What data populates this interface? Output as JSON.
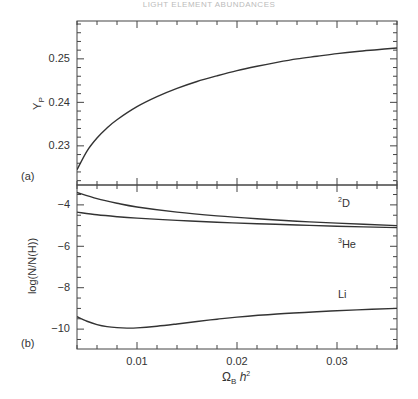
{
  "header": "LIGHT ELEMENT ABUNDANCES",
  "chart_data": [
    {
      "type": "line",
      "panel": "(a)",
      "title": "",
      "xlabel": "",
      "ylabel": "Y_P",
      "xlim": [
        0.004,
        0.036
      ],
      "ylim": [
        0.221,
        0.2587
      ],
      "yticks": [
        "0.23",
        "0.24",
        "0.25"
      ],
      "grid": false,
      "series": [
        {
          "name": "Yp",
          "x": [
            0.004,
            0.005,
            0.006,
            0.007,
            0.008,
            0.01,
            0.012,
            0.014,
            0.016,
            0.018,
            0.02,
            0.022,
            0.024,
            0.026,
            0.028,
            0.03,
            0.032,
            0.034,
            0.036
          ],
          "y": [
            0.2245,
            0.2288,
            0.2318,
            0.2341,
            0.236,
            0.239,
            0.2413,
            0.2432,
            0.2448,
            0.2461,
            0.2473,
            0.2483,
            0.2492,
            0.25,
            0.2506,
            0.2512,
            0.2517,
            0.2521,
            0.2525
          ]
        }
      ]
    },
    {
      "type": "line",
      "panel": "(b)",
      "title": "",
      "xlabel": "Ω_B h^2",
      "ylabel": "log(N/N(H))",
      "xlim": [
        0.004,
        0.036
      ],
      "ylim": [
        -10.96,
        -3.04
      ],
      "xticks": [
        "0.01",
        "0.02",
        "0.03"
      ],
      "yticks": [
        "-4",
        "-6",
        "-8",
        "-10"
      ],
      "grid": false,
      "series": [
        {
          "name": "2D",
          "x": [
            0.004,
            0.006,
            0.008,
            0.01,
            0.014,
            0.018,
            0.022,
            0.026,
            0.03,
            0.036
          ],
          "y": [
            -3.4,
            -3.7,
            -3.92,
            -4.1,
            -4.35,
            -4.53,
            -4.67,
            -4.79,
            -4.88,
            -5.0
          ]
        },
        {
          "name": "3He",
          "x": [
            0.004,
            0.006,
            0.008,
            0.01,
            0.014,
            0.018,
            0.022,
            0.026,
            0.03,
            0.036
          ],
          "y": [
            -4.35,
            -4.48,
            -4.57,
            -4.64,
            -4.75,
            -4.84,
            -4.91,
            -4.97,
            -5.03,
            -5.1
          ]
        },
        {
          "name": "Li",
          "x": [
            0.004,
            0.005,
            0.006,
            0.007,
            0.008,
            0.009,
            0.01,
            0.012,
            0.014,
            0.016,
            0.018,
            0.02,
            0.024,
            0.028,
            0.032,
            0.036
          ],
          "y": [
            -9.4,
            -9.62,
            -9.78,
            -9.88,
            -9.93,
            -9.95,
            -9.94,
            -9.86,
            -9.75,
            -9.63,
            -9.52,
            -9.42,
            -9.27,
            -9.16,
            -9.07,
            -9.0
          ]
        }
      ],
      "annotations": [
        {
          "text": "2D",
          "x": 0.0335,
          "y": -3.85
        },
        {
          "text": "3He",
          "x": 0.0335,
          "y": -5.9
        },
        {
          "text": "Li",
          "x": 0.0335,
          "y": -8.6
        }
      ]
    }
  ],
  "labels": {
    "panel_a": "(a)",
    "panel_b": "(b)",
    "ylabel_a_main": "Y",
    "ylabel_a_sub": "P",
    "ylabel_b": "log(N/N(H))",
    "xlabel_main": "Ω",
    "xlabel_sub": "B",
    "xlabel_h": "h",
    "xlabel_sup": "2",
    "ann_d_sup": "2",
    "ann_d": "D",
    "ann_he_sup": "3",
    "ann_he": "He",
    "ann_li": "Li",
    "yticks_a": [
      "0.25",
      "0.24",
      "0.23"
    ],
    "yticks_b": [
      "−4",
      "−6",
      "−8",
      "−10"
    ],
    "xticks": [
      "0.01",
      "0.02",
      "0.03"
    ]
  },
  "colors": {
    "line": "#333333",
    "axis": "#444444"
  }
}
